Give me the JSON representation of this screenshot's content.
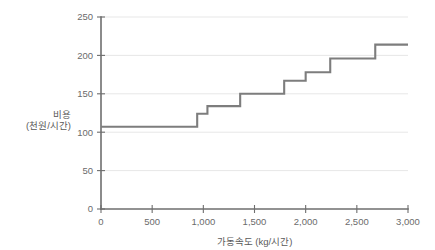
{
  "chart_data": {
    "type": "line",
    "subtype": "step",
    "title": "",
    "subtitle": "",
    "xlabel": "가동속도 (kg/시간)",
    "ylabel": "비용\n(천원/시간)",
    "ylabel_line1": "비용",
    "ylabel_line2": "(천원/시간)",
    "xlim": [
      0,
      3000
    ],
    "ylim": [
      0,
      250
    ],
    "grid": true,
    "grid_axis": "y",
    "legend": false,
    "legend_position": "none",
    "xticks": [
      0,
      500,
      1000,
      1500,
      2000,
      2500,
      3000
    ],
    "xticklabels": [
      "0",
      "500",
      "1,000",
      "1,500",
      "2,000",
      "2,500",
      "3,000"
    ],
    "yticks": [
      0,
      50,
      100,
      150,
      200,
      250
    ],
    "yticklabels": [
      "0",
      "50",
      "100",
      "150",
      "200",
      "250"
    ],
    "series": [
      {
        "name": "비용",
        "color": "#7d7d7d",
        "step_edges": [
          0,
          940,
          1040,
          1360,
          1790,
          2000,
          2240,
          2680,
          3000
        ],
        "values": [
          107,
          124,
          134,
          150,
          167,
          178,
          196,
          214
        ],
        "points": [
          {
            "x": 0,
            "y": 107
          },
          {
            "x": 940,
            "y": 107
          },
          {
            "x": 940,
            "y": 124
          },
          {
            "x": 1040,
            "y": 124
          },
          {
            "x": 1040,
            "y": 134
          },
          {
            "x": 1360,
            "y": 134
          },
          {
            "x": 1360,
            "y": 150
          },
          {
            "x": 1790,
            "y": 150
          },
          {
            "x": 1790,
            "y": 167
          },
          {
            "x": 2000,
            "y": 167
          },
          {
            "x": 2000,
            "y": 178
          },
          {
            "x": 2240,
            "y": 178
          },
          {
            "x": 2240,
            "y": 196
          },
          {
            "x": 2680,
            "y": 196
          },
          {
            "x": 2680,
            "y": 214
          },
          {
            "x": 3000,
            "y": 214
          }
        ]
      }
    ],
    "colors": {
      "series": "#7d7d7d",
      "axis": "#6e6e6e",
      "grid": "#dcdcdc",
      "text": "#6b6b6b",
      "background": "#ffffff"
    }
  }
}
